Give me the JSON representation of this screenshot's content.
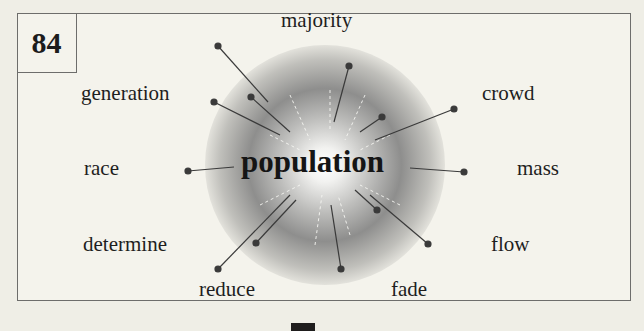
{
  "card": {
    "number": "84",
    "central_word": "population",
    "related_words": [
      {
        "id": "majority",
        "label": "majority"
      },
      {
        "id": "generation",
        "label": "generation"
      },
      {
        "id": "crowd",
        "label": "crowd"
      },
      {
        "id": "race",
        "label": "race"
      },
      {
        "id": "mass",
        "label": "mass"
      },
      {
        "id": "determine",
        "label": "determine"
      },
      {
        "id": "flow",
        "label": "flow"
      },
      {
        "id": "reduce",
        "label": "reduce"
      },
      {
        "id": "fade",
        "label": "fade"
      }
    ]
  }
}
